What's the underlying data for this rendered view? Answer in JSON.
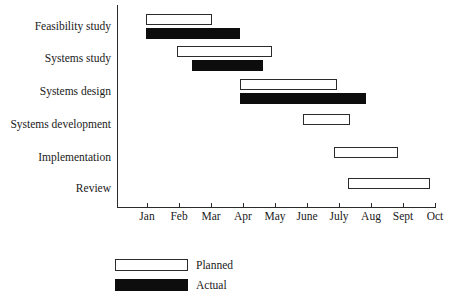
{
  "chart_data": {
    "type": "bar",
    "chart_style": "gantt",
    "title": "",
    "xlabel": "",
    "ylabel": "",
    "grid": false,
    "legend_position": "bottom-left",
    "x_axis": {
      "tick_labels": [
        "Jan",
        "Feb",
        "Mar",
        "Apr",
        "May",
        "June",
        "July",
        "Aug",
        "Sept",
        "Oct"
      ],
      "tick_x_px": [
        147,
        179,
        211,
        243,
        275,
        307,
        339,
        371,
        403,
        435
      ],
      "unit": "month",
      "range": [
        "Jan",
        "Oct"
      ]
    },
    "categories": [
      "Feasibility study",
      "Systems study",
      "Systems design",
      "Systems development",
      "Implementation",
      "Review"
    ],
    "series": [
      {
        "name": "Planned",
        "color": "#ffffff",
        "border_color": "#2b2b2b",
        "bars": [
          {
            "task": "Feasibility study",
            "start": "Jan",
            "end": "Mar",
            "start_px": 146,
            "end_px": 212
          },
          {
            "task": "Systems study",
            "start": "Feb",
            "end": "May",
            "start_px": 177,
            "end_px": 272
          },
          {
            "task": "Systems design",
            "start": "Apr",
            "end": "July",
            "start_px": 240,
            "end_px": 337
          },
          {
            "task": "Systems development",
            "start": "June",
            "end": "July",
            "start_px": 303,
            "end_px": 350
          },
          {
            "task": "Implementation",
            "start": "July",
            "end": "Sept",
            "start_px": 334,
            "end_px": 398
          },
          {
            "task": "Review",
            "start": "Aug",
            "end": "Oct",
            "start_px": 348,
            "end_px": 430
          }
        ]
      },
      {
        "name": "Actual",
        "color": "#0d0d0d",
        "border_color": "#0d0d0d",
        "bars": [
          {
            "task": "Feasibility study",
            "start": "Jan",
            "end": "Apr",
            "start_px": 146,
            "end_px": 240
          },
          {
            "task": "Systems study",
            "start": "Mar",
            "end": "May",
            "start_px": 192,
            "end_px": 263
          },
          {
            "task": "Systems design",
            "start": "Apr",
            "end": "Aug",
            "start_px": 240,
            "end_px": 366
          }
        ]
      }
    ]
  },
  "axis": {
    "ticks": [
      {
        "label": "Jan",
        "x": 147
      },
      {
        "label": "Feb",
        "x": 179
      },
      {
        "label": "Mar",
        "x": 211
      },
      {
        "label": "Apr",
        "x": 243
      },
      {
        "label": "May",
        "x": 275
      },
      {
        "label": "June",
        "x": 307
      },
      {
        "label": "July",
        "x": 339
      },
      {
        "label": "Aug",
        "x": 371
      },
      {
        "label": "Sept",
        "x": 403
      },
      {
        "label": "Oct",
        "x": 435
      }
    ]
  },
  "tasks": [
    {
      "label": "Feasibility study",
      "label_y": 20,
      "planned": {
        "x": 146,
        "w": 66,
        "y": 14
      },
      "actual": {
        "x": 146,
        "w": 94,
        "y": 28
      }
    },
    {
      "label": "Systems study",
      "label_y": 52,
      "planned": {
        "x": 177,
        "w": 95,
        "y": 46
      },
      "actual": {
        "x": 192,
        "w": 71,
        "y": 60
      }
    },
    {
      "label": "Systems design",
      "label_y": 85,
      "planned": {
        "x": 240,
        "w": 97,
        "y": 79
      },
      "actual": {
        "x": 240,
        "w": 126,
        "y": 93
      }
    },
    {
      "label": "Systems development",
      "label_y": 118,
      "planned": {
        "x": 303,
        "w": 47,
        "y": 114
      },
      "actual": null
    },
    {
      "label": "Implementation",
      "label_y": 151,
      "planned": {
        "x": 334,
        "w": 64,
        "y": 147
      },
      "actual": null
    },
    {
      "label": "Review",
      "label_y": 182,
      "planned": {
        "x": 348,
        "w": 82,
        "y": 178
      },
      "actual": null
    }
  ],
  "legend": {
    "items": [
      {
        "label": "Planned",
        "style": "planned",
        "y": 259
      },
      {
        "label": "Actual",
        "style": "actual",
        "y": 279
      }
    ]
  },
  "colors": {
    "planned_fill": "#ffffff",
    "actual_fill": "#0d0d0d",
    "stroke": "#2b2b2b",
    "text": "#1a1a1a",
    "background": "#ffffff"
  }
}
